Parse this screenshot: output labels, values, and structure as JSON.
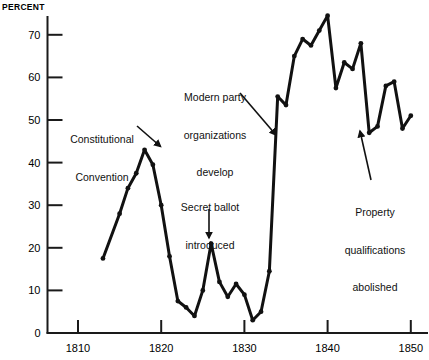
{
  "chart_data": {
    "type": "line",
    "title": "",
    "xlabel": "",
    "ylabel": "PERCENT",
    "xlim": [
      1812,
      1851
    ],
    "ylim": [
      0,
      76
    ],
    "grid": false,
    "legend_position": "none",
    "x_ticks": [
      1810,
      1820,
      1830,
      1840,
      1850
    ],
    "y_ticks": [
      0,
      10,
      20,
      30,
      40,
      50,
      60,
      70
    ],
    "series": [
      {
        "name": "Percent",
        "x": [
          1813,
          1815,
          1816,
          1817,
          1818,
          1819,
          1820,
          1821,
          1822,
          1823,
          1824,
          1825,
          1826,
          1827,
          1828,
          1829,
          1830,
          1831,
          1832,
          1833,
          1834,
          1835,
          1836,
          1837,
          1838,
          1839,
          1840,
          1841,
          1842,
          1843,
          1844,
          1845,
          1846,
          1847,
          1848,
          1849,
          1850
        ],
        "y": [
          17.5,
          28,
          34,
          37.5,
          43,
          39.5,
          30,
          18,
          7.5,
          6,
          4,
          10,
          21,
          12,
          8.5,
          11.5,
          9,
          3,
          5,
          14.5,
          55.5,
          53.5,
          65,
          69,
          67.5,
          71,
          74.5,
          57.5,
          63.5,
          62,
          68,
          47,
          48.5,
          58,
          59,
          48,
          51
        ]
      }
    ],
    "annotations": [
      {
        "id": "constitutional-convention",
        "text": "Constitutional\nConvention",
        "x_pct": 13.0,
        "y_pct": 30.5
      },
      {
        "id": "modern-party-organizations",
        "text": "Modern party\norganizations\ndevelop",
        "x_pct": 41.5,
        "y_pct": 18.5
      },
      {
        "id": "secret-ballot",
        "text": "Secret ballot\nintroduced",
        "x_pct": 40.5,
        "y_pct": 50.0
      },
      {
        "id": "property-qualifications",
        "text": "Property\nqualifications\nabolished",
        "x_pct": 88.0,
        "y_pct": 54.0
      }
    ]
  },
  "axis": {
    "y_title": "PERCENT",
    "y_tick_labels": [
      "70",
      "60",
      "50",
      "40",
      "30",
      "20",
      "10",
      "0"
    ],
    "x_tick_labels": [
      "1810",
      "1820",
      "1830",
      "1840",
      "1850"
    ]
  },
  "annotations": {
    "constitutional_convention": {
      "line1": "Constitutional",
      "line2": "Convention"
    },
    "modern_party": {
      "line1": "Modern party",
      "line2": "organizations",
      "line3": "develop"
    },
    "secret_ballot": {
      "line1": "Secret ballot",
      "line2": "introduced"
    },
    "property_qualifications": {
      "line1": "Property",
      "line2": "qualifications",
      "line3": "abolished"
    }
  },
  "colors": {
    "line": "#111111",
    "axis": "#1a1a1a",
    "background": "#ffffff"
  }
}
